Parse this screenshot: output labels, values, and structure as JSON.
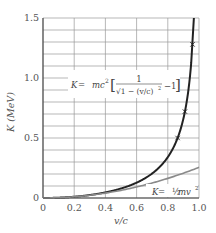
{
  "chart_data": {
    "type": "line",
    "title": "",
    "xlabel": "v/c",
    "ylabel": "K (MeV)",
    "xlim": [
      0,
      1.0
    ],
    "ylim": [
      0,
      1.5
    ],
    "x_ticks": [
      "0",
      "0.2",
      "0.4",
      "0.6",
      "0.8",
      "1.0"
    ],
    "y_ticks": [
      "0",
      "0.5",
      "1.0",
      "1.5"
    ],
    "grid": true,
    "grid_x_step": 0.2,
    "grid_y_step": 0.1,
    "rest_energy_mc2_MeV": 0.511,
    "series": [
      {
        "name": "relativistic",
        "label": "K = mc² [ 1/√(1 − (v/c)²) − 1 ]",
        "color": "#222222",
        "x": [
          0,
          0.1,
          0.2,
          0.3,
          0.4,
          0.5,
          0.6,
          0.7,
          0.75,
          0.8,
          0.85,
          0.88,
          0.9,
          0.92,
          0.93,
          0.94,
          0.945
        ],
        "values": [
          0,
          0.0026,
          0.0105,
          0.0247,
          0.0465,
          0.079,
          0.128,
          0.205,
          0.262,
          0.341,
          0.459,
          0.565,
          0.661,
          0.793,
          0.879,
          0.987,
          1.05
        ]
      },
      {
        "name": "classical",
        "label": "K = ½ mv²",
        "color": "#8a8a8a",
        "x": [
          0,
          0.2,
          0.4,
          0.6,
          0.8,
          1.0
        ],
        "values": [
          0,
          0.0102,
          0.0409,
          0.092,
          0.1635,
          0.2555
        ]
      },
      {
        "name": "experimental",
        "marker": "x",
        "color": "#222222",
        "x": [
          0.868,
          0.91,
          0.957
        ],
        "values": [
          0.5,
          0.72,
          1.28
        ]
      }
    ],
    "annotations": [
      {
        "text": "K = mc² [ 1/√(1 − (v/c)²) − 1 ]",
        "x": 0.25,
        "y": 0.9
      },
      {
        "text": "K = ½ mv²",
        "x": 0.72,
        "y": 0.06
      }
    ]
  },
  "labels": {
    "x_axis": "v/c",
    "y_axis": "K (MeV)",
    "rel_K": "K",
    "rel_eq": " = ",
    "rel_mc2": "mc",
    "rel_sq": "2",
    "rel_num": "1",
    "rel_sqrt": "√1 − (v/c)",
    "rel_sqrt_exp": "2",
    "rel_minus1": "−1",
    "cls_K": "K",
    "cls_eq": " = ",
    "cls_half": "½",
    "cls_mv": " mv",
    "cls_sq": "2"
  }
}
